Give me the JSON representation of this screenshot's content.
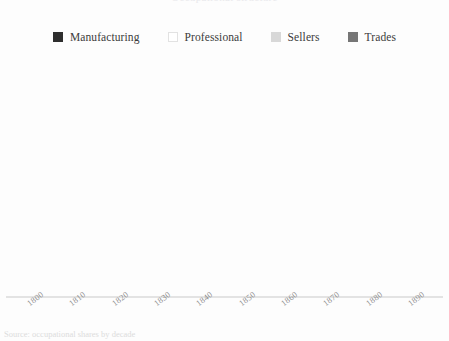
{
  "figure": {
    "background_color": "#fdfdfd",
    "title_cropped": "Occupational structure",
    "caption_cropped": "Source: occupational shares by decade"
  },
  "legend": {
    "position": "top-center",
    "items": [
      {
        "label": "Manufacturing",
        "color": "#2e2e2e",
        "outlined": false
      },
      {
        "label": "Professional",
        "color": "#ffffff",
        "outlined": true
      },
      {
        "label": "Sellers",
        "color": "#d8d8d8",
        "outlined": false
      },
      {
        "label": "Trades",
        "color": "#767676",
        "outlined": false
      }
    ]
  },
  "axis": {
    "line_color": "#e3e3e3",
    "tick_label_color": "#8d8d8d",
    "tick_rotation_deg": -37
  },
  "chart_data": {
    "type": "bar",
    "stacked": true,
    "normalized_percent": true,
    "title": "Occupational structure",
    "xlabel": "",
    "ylabel": "",
    "ylim": [
      0,
      100
    ],
    "grid": false,
    "legend_position": "top-center",
    "categories": [
      "1800",
      "1810",
      "1820",
      "1830",
      "1840",
      "1850",
      "1860",
      "1870",
      "1880",
      "1890"
    ],
    "series": [
      {
        "name": "Manufacturing",
        "color": "#2e2e2e",
        "values": [
          12,
          14,
          14,
          17,
          11,
          19,
          15,
          19,
          9,
          10
        ]
      },
      {
        "name": "Professional",
        "color": "#ffffff",
        "values": [
          6,
          6,
          6,
          12,
          22,
          25,
          30,
          28,
          36,
          31
        ]
      },
      {
        "name": "Sellers",
        "color": "#d8d8d8",
        "values": [
          22,
          32,
          32,
          22,
          41,
          35,
          41,
          40,
          38,
          41
        ]
      },
      {
        "name": "Trades",
        "color": "#767676",
        "values": [
          60,
          48,
          48,
          49,
          26,
          21,
          14,
          13,
          17,
          18
        ]
      }
    ]
  }
}
